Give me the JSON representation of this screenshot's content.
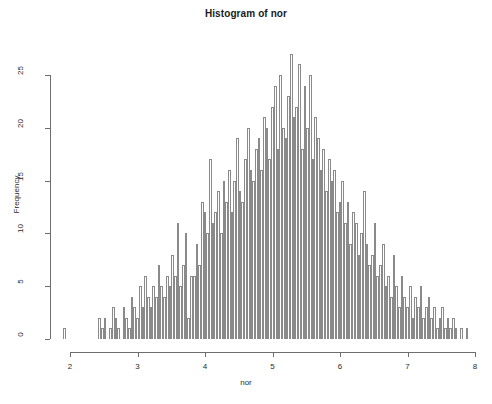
{
  "chart_data": {
    "type": "bar",
    "title": "Histogram of nor",
    "xlabel": "nor",
    "ylabel": "Frequency",
    "xlim": [
      1.9,
      8.05
    ],
    "ylim": [
      0,
      27
    ],
    "xticks": [
      2,
      3,
      4,
      5,
      6,
      7,
      8
    ],
    "xtick_labels": [
      "2",
      "3",
      "4",
      "5",
      "6",
      "7",
      "8"
    ],
    "yticks": [
      0,
      5,
      10,
      15,
      20,
      25
    ],
    "ytick_labels": [
      "0",
      "5",
      "10",
      "15",
      "20",
      "25"
    ],
    "grid": false,
    "legend": null,
    "bin_width": 0.04,
    "bin_starts": [
      1.9,
      1.94,
      1.98,
      2.02,
      2.06,
      2.1,
      2.14,
      2.18,
      2.22,
      2.26,
      2.3,
      2.34,
      2.38,
      2.42,
      2.46,
      2.5,
      2.54,
      2.58,
      2.62,
      2.66,
      2.7,
      2.74,
      2.78,
      2.82,
      2.86,
      2.9,
      2.94,
      2.98,
      3.02,
      3.06,
      3.1,
      3.14,
      3.18,
      3.22,
      3.26,
      3.3,
      3.34,
      3.38,
      3.42,
      3.46,
      3.5,
      3.54,
      3.58,
      3.62,
      3.66,
      3.7,
      3.74,
      3.78,
      3.82,
      3.86,
      3.9,
      3.94,
      3.98,
      4.02,
      4.06,
      4.1,
      4.14,
      4.18,
      4.22,
      4.26,
      4.3,
      4.34,
      4.38,
      4.42,
      4.46,
      4.5,
      4.54,
      4.58,
      4.62,
      4.66,
      4.7,
      4.74,
      4.78,
      4.82,
      4.86,
      4.9,
      4.94,
      4.98,
      5.02,
      5.06,
      5.1,
      5.14,
      5.18,
      5.22,
      5.26,
      5.3,
      5.34,
      5.38,
      5.42,
      5.46,
      5.5,
      5.54,
      5.58,
      5.62,
      5.66,
      5.7,
      5.74,
      5.78,
      5.82,
      5.86,
      5.9,
      5.94,
      5.98,
      6.02,
      6.06,
      6.1,
      6.14,
      6.18,
      6.22,
      6.26,
      6.3,
      6.34,
      6.38,
      6.42,
      6.46,
      6.5,
      6.54,
      6.58,
      6.62,
      6.66,
      6.7,
      6.74,
      6.78,
      6.82,
      6.86,
      6.9,
      6.94,
      6.98,
      7.02,
      7.06,
      7.1,
      7.14,
      7.18,
      7.22,
      7.26,
      7.3,
      7.34,
      7.38,
      7.42,
      7.46,
      7.5,
      7.54,
      7.58,
      7.62,
      7.66,
      7.7,
      7.74,
      7.78,
      7.82,
      7.86
    ],
    "values": [
      1,
      0,
      0,
      0,
      0,
      0,
      0,
      0,
      0,
      0,
      0,
      0,
      0,
      2,
      1,
      2,
      0,
      1,
      3,
      2,
      1,
      0,
      3,
      2,
      1,
      4,
      3,
      2,
      5,
      3,
      6,
      4,
      3,
      5,
      4,
      7,
      5,
      4,
      6,
      5,
      8,
      6,
      11,
      5,
      7,
      10,
      2,
      6,
      6,
      9,
      7,
      13,
      12,
      10,
      17,
      11,
      12,
      14,
      10,
      15,
      13,
      16,
      12,
      15,
      19,
      14,
      13,
      17,
      20,
      16,
      15,
      18,
      19,
      16,
      21,
      20,
      17,
      22,
      24,
      18,
      25,
      20,
      19,
      23,
      27,
      21,
      22,
      26,
      18,
      24,
      20,
      25,
      17,
      21,
      19,
      16,
      18,
      14,
      17,
      15,
      16,
      12,
      13,
      15,
      11,
      13,
      9,
      12,
      11,
      8,
      10,
      14,
      9,
      7,
      8,
      11,
      6,
      7,
      9,
      5,
      6,
      4,
      8,
      5,
      3,
      6,
      4,
      3,
      5,
      2,
      4,
      3,
      5,
      2,
      3,
      4,
      2,
      3,
      1,
      2,
      3,
      1,
      2,
      1,
      2,
      1,
      0,
      1,
      0,
      1
    ]
  },
  "colors": {
    "bar_border": "#8a8a8a",
    "bar_fill": "#ffffff",
    "axis": "#6e6e6e",
    "text": "#2b2b2b",
    "background": "#ffffff"
  }
}
